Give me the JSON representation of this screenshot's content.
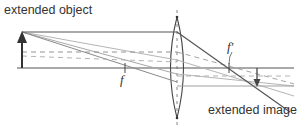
{
  "diagram": {
    "labels": {
      "object": "extended object",
      "image": "extended image",
      "focal_front": "f",
      "focal_back": "f′"
    },
    "colors": {
      "axis": "#555555",
      "primary_ray": "#555555",
      "secondary_ray": "#b0b0b0",
      "dashed_ray": "#888888",
      "lens": "#444444",
      "arrow": "#333333",
      "text": "#333333"
    },
    "geometry": {
      "optical_axis": {
        "x1": 17,
        "x2": 294,
        "y": 68
      },
      "lens": {
        "cx": 177,
        "top": 17,
        "bottom": 118,
        "half_width": 10
      },
      "object_arrow": {
        "x": 22,
        "base_y": 68,
        "tip_y": 32
      },
      "image_arrow": {
        "x": 257,
        "base_y": 68,
        "tip_y": 86
      },
      "focal_point_front": {
        "x": 125,
        "y": 68
      },
      "focal_point_back": {
        "x": 229,
        "y": 68
      }
    }
  }
}
